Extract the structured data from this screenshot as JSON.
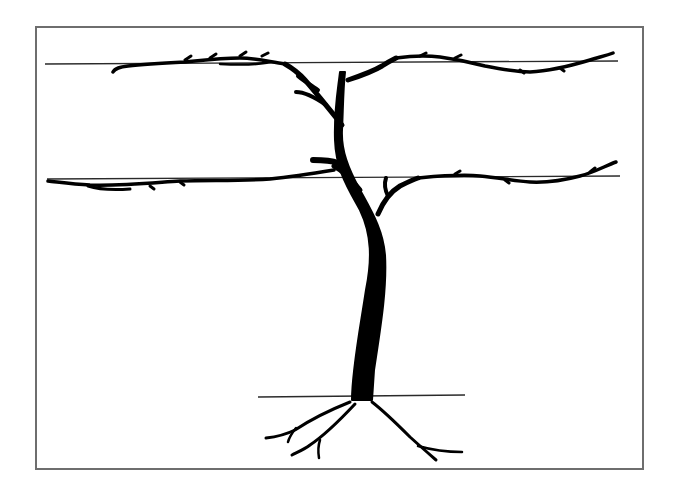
{
  "diagram": {
    "type": "grapevine-training-system",
    "colors": {
      "background": "#ffffff",
      "frame": "#6e6e6e",
      "wire": "#2a2a2a",
      "vine": "#000000"
    },
    "frame": {
      "x": 36,
      "y": 27,
      "width": 607,
      "height": 442
    },
    "wires": [
      {
        "name": "top-wire",
        "x1": 45,
        "x2": 618,
        "y": 63
      },
      {
        "name": "middle-wire",
        "x1": 47,
        "x2": 620,
        "y": 176
      },
      {
        "name": "ground-line",
        "x1": 258,
        "x2": 465,
        "y": 396
      }
    ],
    "labels": []
  }
}
